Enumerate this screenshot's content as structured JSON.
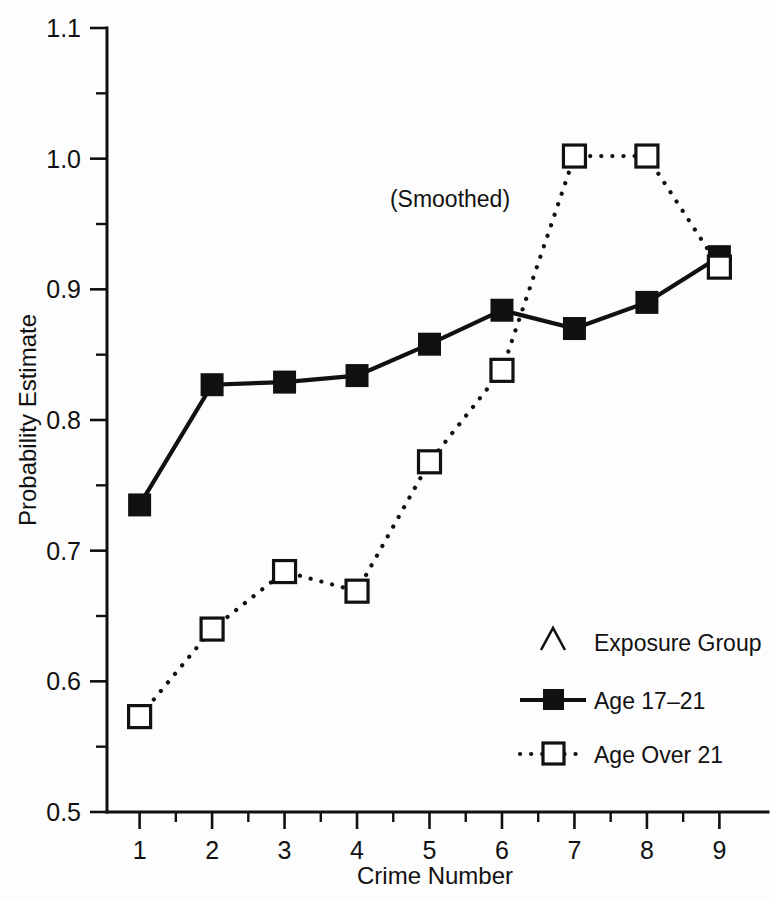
{
  "chart_data": {
    "type": "line",
    "title": "",
    "annotation": "(Smoothed)",
    "xlabel": "Crime Number",
    "ylabel": "Probability Estimate",
    "x": [
      1,
      2,
      3,
      4,
      5,
      6,
      7,
      8,
      9
    ],
    "xtick_labels": [
      "1",
      "2",
      "3",
      "4",
      "5",
      "6",
      "7",
      "8",
      "9"
    ],
    "ytick_labels": [
      "0.5",
      "0.6",
      "0.7",
      "0.8",
      "0.9",
      "1.0",
      "1.1"
    ],
    "ytick_values": [
      0.5,
      0.6,
      0.7,
      0.8,
      0.9,
      1.0,
      1.1
    ],
    "yminor_values": [
      0.55,
      0.65,
      0.75,
      0.85,
      0.95,
      1.05
    ],
    "xlim": [
      0.55,
      9.45
    ],
    "ylim": [
      0.5,
      1.1
    ],
    "grid": false,
    "legend_position": "lower-right",
    "legend_title": "Exposure Group",
    "legend_title_marker": "caret",
    "series": [
      {
        "name": "Age 17–21",
        "marker": "filled-square",
        "line": "solid",
        "values": [
          0.735,
          0.827,
          0.829,
          0.834,
          0.858,
          0.884,
          0.87,
          0.89,
          0.925
        ]
      },
      {
        "name": "Age Over 21",
        "marker": "open-square",
        "line": "dotted",
        "values": [
          0.573,
          0.64,
          0.684,
          0.669,
          0.768,
          0.838,
          1.002,
          1.002,
          0.917
        ]
      }
    ],
    "colors": {
      "foreground": "#111111",
      "background": "#fdfdfd"
    }
  }
}
